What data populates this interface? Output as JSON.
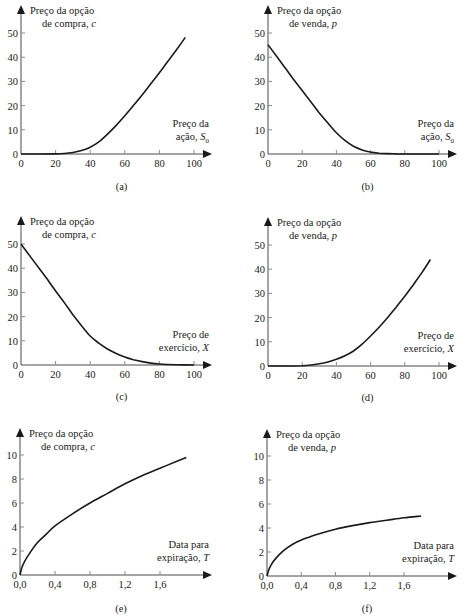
{
  "chart_data": [
    {
      "id": "a",
      "type": "line",
      "caption": "(a)",
      "ylabel_line1": "Preço da opção",
      "ylabel_line2": "de compra, ",
      "ylabel_var": "c",
      "xlabel_line1": "Preço da",
      "xlabel_line2": "ação, ",
      "xlabel_var": "S",
      "xlabel_sub": "0",
      "xlim": [
        0,
        110
      ],
      "ylim": [
        0,
        55
      ],
      "xticks": [
        0,
        20,
        40,
        60,
        80,
        100
      ],
      "xtick_labels": [
        "0",
        "20",
        "40",
        "60",
        "80",
        "100"
      ],
      "yticks": [
        0,
        10,
        20,
        30,
        40,
        50
      ],
      "ytick_labels": [
        "0",
        "10",
        "20",
        "30",
        "40",
        "50"
      ],
      "x": [
        0,
        10,
        20,
        25,
        30,
        35,
        40,
        45,
        50,
        55,
        60,
        65,
        70,
        75,
        80,
        85,
        90,
        95
      ],
      "y": [
        0,
        0,
        0.05,
        0.2,
        0.6,
        1.4,
        2.8,
        5.0,
        8.2,
        11.8,
        15.8,
        20.0,
        24.4,
        29.0,
        33.6,
        38.4,
        43.2,
        48.2
      ]
    },
    {
      "id": "b",
      "type": "line",
      "caption": "(b)",
      "ylabel_line1": "Preço da opção",
      "ylabel_line2": "de venda, ",
      "ylabel_var": "p",
      "xlabel_line1": "Preço da",
      "xlabel_line2": "ação, ",
      "xlabel_var": "S",
      "xlabel_sub": "0",
      "xlim": [
        0,
        110
      ],
      "ylim": [
        0,
        55
      ],
      "xticks": [
        0,
        20,
        40,
        60,
        80,
        100
      ],
      "xtick_labels": [
        "0",
        "20",
        "40",
        "60",
        "80",
        "100"
      ],
      "yticks": [
        0,
        10,
        20,
        30,
        40,
        50
      ],
      "ytick_labels": [
        "0",
        "10",
        "20",
        "30",
        "40",
        "50"
      ],
      "x": [
        0,
        5,
        10,
        15,
        20,
        25,
        30,
        35,
        40,
        45,
        50,
        55,
        60,
        65,
        70,
        75,
        80,
        90,
        100
      ],
      "y": [
        45.2,
        40.4,
        35.6,
        30.8,
        26.2,
        21.6,
        17.0,
        12.8,
        8.8,
        5.6,
        3.2,
        1.7,
        0.8,
        0.35,
        0.15,
        0.05,
        0.02,
        0,
        0
      ]
    },
    {
      "id": "c",
      "type": "line",
      "caption": "(c)",
      "ylabel_line1": "Preço da opção",
      "ylabel_line2": "de compra, ",
      "ylabel_var": "c",
      "xlabel_line1": "Preço de",
      "xlabel_line2": "exercício, ",
      "xlabel_var": "X",
      "xlabel_sub": "",
      "xlim": [
        0,
        110
      ],
      "ylim": [
        0,
        55
      ],
      "xticks": [
        0,
        20,
        40,
        60,
        80,
        100
      ],
      "xtick_labels": [
        "0",
        "20",
        "40",
        "60",
        "80",
        "100"
      ],
      "yticks": [
        0,
        10,
        20,
        30,
        40,
        50
      ],
      "ytick_labels": [
        "0",
        "10",
        "20",
        "30",
        "40",
        "50"
      ],
      "x": [
        0,
        5,
        10,
        15,
        20,
        25,
        30,
        35,
        40,
        45,
        50,
        55,
        60,
        65,
        70,
        75,
        80,
        90,
        100
      ],
      "y": [
        50,
        45.2,
        40.4,
        35.6,
        30.6,
        25.8,
        20.8,
        16.2,
        12.0,
        9.0,
        6.6,
        4.8,
        3.3,
        2.2,
        1.4,
        0.8,
        0.4,
        0.1,
        0
      ]
    },
    {
      "id": "d",
      "type": "line",
      "caption": "(d)",
      "ylabel_line1": "Preço da opção",
      "ylabel_line2": "de venda, ",
      "ylabel_var": "p",
      "xlabel_line1": "Preço de",
      "xlabel_line2": "exercício, ",
      "xlabel_var": "X",
      "xlabel_sub": "",
      "xlim": [
        0,
        110
      ],
      "ylim": [
        0,
        55
      ],
      "xticks": [
        0,
        20,
        40,
        60,
        80,
        100
      ],
      "xtick_labels": [
        "0",
        "20",
        "40",
        "60",
        "80",
        "100"
      ],
      "yticks": [
        0,
        10,
        20,
        30,
        40,
        50
      ],
      "ytick_labels": [
        "0",
        "10",
        "20",
        "30",
        "40",
        "50"
      ],
      "x": [
        0,
        10,
        20,
        25,
        30,
        35,
        40,
        45,
        50,
        55,
        60,
        65,
        70,
        75,
        80,
        85,
        90,
        95
      ],
      "y": [
        0,
        0,
        0.1,
        0.4,
        0.9,
        1.7,
        2.8,
        4.2,
        6.2,
        9.0,
        12.4,
        16.0,
        20.0,
        24.4,
        28.8,
        33.6,
        38.6,
        44.0
      ]
    },
    {
      "id": "e",
      "type": "line",
      "caption": "(e)",
      "ylabel_line1": "Preço da opção",
      "ylabel_line2": "de compra, ",
      "ylabel_var": "c",
      "xlabel_line1": "Data para",
      "xlabel_line2": "expiração, ",
      "xlabel_var": "T",
      "xlabel_sub": "",
      "xlim": [
        0,
        2.2
      ],
      "ylim": [
        0,
        11
      ],
      "xticks": [
        0,
        0.4,
        0.8,
        1.2,
        1.6
      ],
      "xtick_labels": [
        "0,0",
        "0,4",
        "0,8",
        "1,2",
        "1,6"
      ],
      "yticks": [
        0,
        2,
        4,
        6,
        8,
        10
      ],
      "ytick_labels": [
        "0",
        "2",
        "4",
        "6",
        "8",
        "10"
      ],
      "x": [
        0,
        0.02,
        0.05,
        0.1,
        0.2,
        0.3,
        0.4,
        0.6,
        0.8,
        1.0,
        1.2,
        1.4,
        1.6,
        1.8,
        1.9
      ],
      "y": [
        0,
        0.6,
        1.1,
        1.7,
        2.7,
        3.4,
        4.1,
        5.1,
        6.0,
        6.8,
        7.6,
        8.3,
        8.9,
        9.5,
        9.8
      ]
    },
    {
      "id": "f",
      "type": "line",
      "caption": "(f)",
      "ylabel_line1": "Preço da opção",
      "ylabel_line2": "de venda, ",
      "ylabel_var": "p",
      "xlabel_line1": "Data para",
      "xlabel_line2": "expiração, ",
      "xlabel_var": "T",
      "xlabel_sub": "",
      "xlim": [
        0,
        2.2
      ],
      "ylim": [
        0,
        11
      ],
      "xticks": [
        0,
        0.4,
        0.8,
        1.2,
        1.6
      ],
      "xtick_labels": [
        "0,0",
        "0,4",
        "0,8",
        "1,2",
        "1,6"
      ],
      "yticks": [
        0,
        2,
        4,
        6,
        8,
        10
      ],
      "ytick_labels": [
        "0",
        "2",
        "4",
        "6",
        "8",
        "10"
      ],
      "x": [
        0,
        0.02,
        0.05,
        0.1,
        0.2,
        0.3,
        0.4,
        0.6,
        0.8,
        1.0,
        1.2,
        1.4,
        1.6,
        1.8
      ],
      "y": [
        0,
        0.5,
        0.95,
        1.45,
        2.15,
        2.65,
        3.0,
        3.5,
        3.9,
        4.2,
        4.45,
        4.65,
        4.85,
        5.0
      ]
    }
  ]
}
